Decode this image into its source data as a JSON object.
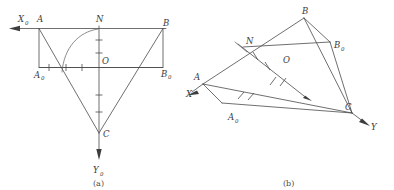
{
  "figure": {
    "background_color": "#ffffff",
    "line_color": "#4a4a4a",
    "label_color": "#3a3a3a",
    "panels": [
      {
        "caption": "(a)",
        "description": "orthographic projection view",
        "axes": [
          {
            "name": "X0",
            "label": "X",
            "subscript": "0",
            "direction": "left"
          },
          {
            "name": "Y0",
            "label": "Y",
            "subscript": "0",
            "direction": "down"
          }
        ],
        "points": [
          {
            "name": "A",
            "label": "A",
            "subscript": ""
          },
          {
            "name": "N",
            "label": "N",
            "subscript": ""
          },
          {
            "name": "B",
            "label": "B",
            "subscript": ""
          },
          {
            "name": "A0",
            "label": "A",
            "subscript": "0"
          },
          {
            "name": "O",
            "label": "O",
            "subscript": ""
          },
          {
            "name": "B0",
            "label": "B",
            "subscript": "0"
          },
          {
            "name": "C",
            "label": "C",
            "subscript": ""
          }
        ]
      },
      {
        "caption": "(b)",
        "description": "oblique perspective view",
        "axes": [
          {
            "name": "X",
            "label": "X",
            "subscript": "",
            "direction": "lower-left"
          },
          {
            "name": "Y",
            "label": "Y",
            "subscript": "",
            "direction": "lower-right"
          }
        ],
        "points": [
          {
            "name": "B",
            "label": "B",
            "subscript": ""
          },
          {
            "name": "B0",
            "label": "B",
            "subscript": "0"
          },
          {
            "name": "N",
            "label": "N",
            "subscript": ""
          },
          {
            "name": "O",
            "label": "O",
            "subscript": ""
          },
          {
            "name": "A",
            "label": "A",
            "subscript": ""
          },
          {
            "name": "A0",
            "label": "A",
            "subscript": "0"
          },
          {
            "name": "C",
            "label": "C",
            "subscript": ""
          }
        ]
      }
    ]
  }
}
